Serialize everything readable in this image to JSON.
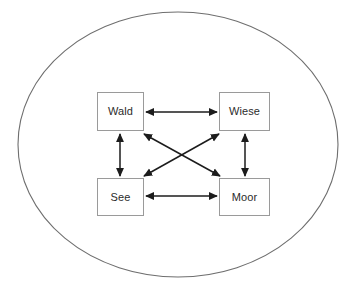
{
  "diagram": {
    "type": "relation-diagram",
    "title": "",
    "boundary": {
      "shape": "ellipse",
      "label": "",
      "stroke_color": "#6e6e6e",
      "fill_color": "#ffffff",
      "cx": 178,
      "cy": 144.5,
      "rx": 160,
      "ry": 132.5
    },
    "background_color": "#ffffff",
    "nodes": [
      {
        "id": "wald",
        "label": "Wald",
        "x": 97,
        "y": 92,
        "width": 47,
        "height": 39,
        "border_color": "#9a9a9a",
        "fill_color": "#ffffff",
        "text_color": "#2b2b2b"
      },
      {
        "id": "wiese",
        "label": "Wiese",
        "x": 219,
        "y": 92,
        "width": 51,
        "height": 39,
        "border_color": "#9a9a9a",
        "fill_color": "#ffffff",
        "text_color": "#2b2b2b"
      },
      {
        "id": "see",
        "label": "See",
        "x": 97,
        "y": 178,
        "width": 47,
        "height": 38,
        "border_color": "#9a9a9a",
        "fill_color": "#ffffff",
        "text_color": "#2b2b2b"
      },
      {
        "id": "moor",
        "label": "Moor",
        "x": 219,
        "y": 178,
        "width": 51,
        "height": 38,
        "border_color": "#9a9a9a",
        "fill_color": "#ffffff",
        "text_color": "#2b2b2b"
      }
    ],
    "edges": [
      {
        "id": "wald-wiese",
        "from": "wald",
        "to": "wiese",
        "orientation": "horizontal",
        "arrowheads": "both",
        "label": "",
        "x1": 146,
        "y1": 112,
        "x2": 217,
        "y2": 112,
        "color": "#1c1c1c"
      },
      {
        "id": "see-moor",
        "from": "see",
        "to": "moor",
        "orientation": "horizontal",
        "arrowheads": "both",
        "label": "",
        "x1": 146,
        "y1": 196,
        "x2": 217,
        "y2": 196,
        "color": "#1c1c1c"
      },
      {
        "id": "wald-see",
        "from": "wald",
        "to": "see",
        "orientation": "vertical",
        "arrowheads": "both",
        "label": "",
        "x1": 120,
        "y1": 133,
        "x2": 120,
        "y2": 176,
        "color": "#1c1c1c"
      },
      {
        "id": "wiese-moor",
        "from": "wiese",
        "to": "moor",
        "orientation": "vertical",
        "arrowheads": "both",
        "label": "",
        "x1": 245,
        "y1": 133,
        "x2": 245,
        "y2": 176,
        "color": "#1c1c1c"
      },
      {
        "id": "wald-moor",
        "from": "wald",
        "to": "moor",
        "orientation": "diagonal",
        "arrowheads": "both",
        "label": "",
        "x1": 144,
        "y1": 133,
        "x2": 219,
        "y2": 176,
        "color": "#1c1c1c"
      },
      {
        "id": "wiese-see",
        "from": "wiese",
        "to": "see",
        "orientation": "diagonal",
        "arrowheads": "both",
        "label": "",
        "x1": 219,
        "y1": 133,
        "x2": 144,
        "y2": 176,
        "color": "#1c1c1c"
      }
    ]
  }
}
